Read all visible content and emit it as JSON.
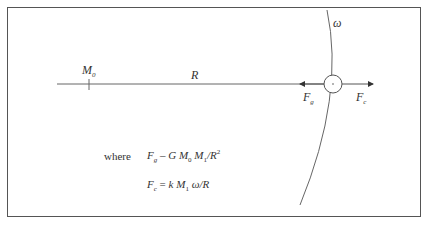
{
  "diagram": {
    "labels": {
      "mass0": "M",
      "mass0_sub": "0",
      "radius": "R",
      "omega": "ω",
      "force_g": "F",
      "force_g_sub": "g",
      "force_c": "F",
      "force_c_sub": "c"
    },
    "where_label": "where",
    "formula1": {
      "lhs": "F",
      "lhs_sub": "g",
      "op": "–",
      "G": "G",
      "M0": "M",
      "M0_sub": "0",
      "M1": "M",
      "M1_sub": "1",
      "div": "/R",
      "exp": "2"
    },
    "formula2": {
      "lhs": "F",
      "lhs_sub": "c",
      "op": "=",
      "k": "k",
      "M1": "M",
      "M1_sub": "1",
      "rest": "ω/R"
    },
    "colors": {
      "line": "#555555",
      "frame": "#555555",
      "text": "#333333"
    }
  }
}
